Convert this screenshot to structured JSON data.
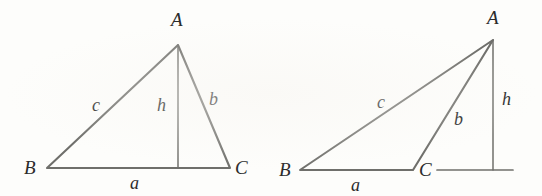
{
  "figure": {
    "background_color": "#fdfdfb",
    "stroke_color": "#6f6f6b",
    "label_color": "#2b2b2b"
  },
  "diagrams": [
    {
      "name": "acute-triangle",
      "description": "Acute triangle ABC with altitude h from A meeting base BC inside the segment",
      "vertices": [
        {
          "label": "A",
          "x": 178,
          "y": 45
        },
        {
          "label": "B",
          "x": 47,
          "y": 168
        },
        {
          "label": "C",
          "x": 230,
          "y": 168
        }
      ],
      "vertex_labels": [
        {
          "text": "A",
          "x": 171,
          "y": 10
        },
        {
          "text": "B",
          "x": 24,
          "y": 158
        },
        {
          "text": "C",
          "x": 235,
          "y": 158
        }
      ],
      "altitude": {
        "from_x": 178,
        "from_y": 45,
        "foot_x": 178,
        "foot_y": 168
      },
      "side_labels": [
        {
          "text": "c",
          "x": 92,
          "y": 96
        },
        {
          "text": "h",
          "x": 157,
          "y": 96
        },
        {
          "text": "b",
          "x": 209,
          "y": 90
        },
        {
          "text": "a",
          "x": 130,
          "y": 174
        }
      ],
      "base_extension": null
    },
    {
      "name": "obtuse-triangle",
      "description": "Obtuse triangle ABC with altitude h from A meeting the extension of base BC outside the segment",
      "vertices": [
        {
          "label": "A",
          "x": 493,
          "y": 40
        },
        {
          "label": "B",
          "x": 300,
          "y": 170
        },
        {
          "label": "C",
          "x": 413,
          "y": 170
        }
      ],
      "vertex_labels": [
        {
          "text": "A",
          "x": 487,
          "y": 8
        },
        {
          "text": "B",
          "x": 279,
          "y": 160
        },
        {
          "text": "C",
          "x": 419,
          "y": 160
        }
      ],
      "altitude": {
        "from_x": 493,
        "from_y": 40,
        "foot_x": 493,
        "foot_y": 170
      },
      "side_labels": [
        {
          "text": "c",
          "x": 377,
          "y": 93
        },
        {
          "text": "b",
          "x": 454,
          "y": 110
        },
        {
          "text": "h",
          "x": 502,
          "y": 90
        },
        {
          "text": "a",
          "x": 351,
          "y": 176
        }
      ],
      "base_extension": {
        "x1": 437,
        "y1": 170,
        "x2": 513,
        "y2": 170
      }
    }
  ]
}
